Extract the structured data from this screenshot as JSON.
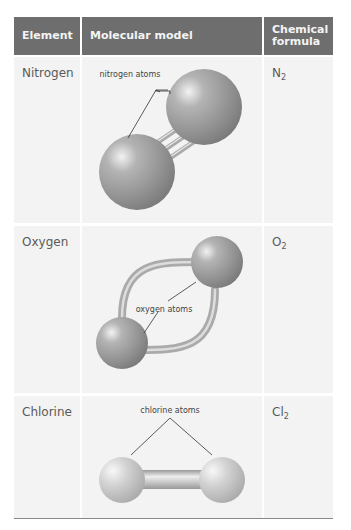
{
  "header": {
    "col_element": "Element",
    "col_model": "Molecular model",
    "col_formula_line1": "Chemical",
    "col_formula_line2": "formula"
  },
  "rows": [
    {
      "element": "Nitrogen",
      "model_label": "nitrogen atoms",
      "formula_symbol": "N",
      "formula_subscript": "2"
    },
    {
      "element": "Oxygen",
      "model_label": "oxygen atoms",
      "formula_symbol": "O",
      "formula_subscript": "2"
    },
    {
      "element": "Chlorine",
      "model_label": "chlorine atoms",
      "formula_symbol": "Cl",
      "formula_subscript": "2"
    }
  ],
  "colors": {
    "header_bg": "#6e6e6e",
    "header_text": "#f4f4f4",
    "cell_bg": "#f3f3f3",
    "atom": "#9a9a9a",
    "chlorine_atom": "#c8c8c8"
  }
}
